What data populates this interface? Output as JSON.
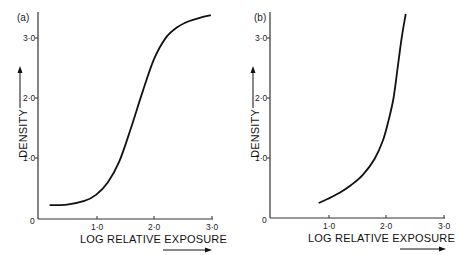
{
  "chart_data": [
    {
      "type": "line",
      "panel": "(a)",
      "xlabel": "LOG RELATIVE EXPOSURE",
      "ylabel": "DENSITY",
      "xlim": [
        0,
        3.0
      ],
      "ylim": [
        0,
        3.4
      ],
      "xticks": [
        "1·0",
        "2·0",
        "3·0"
      ],
      "yticks": [
        "0",
        "1·0",
        "2·0",
        "3·0"
      ],
      "grid": false,
      "x": [
        0.2,
        0.5,
        0.8,
        1.0,
        1.2,
        1.4,
        1.6,
        1.8,
        2.0,
        2.2,
        2.4,
        2.6,
        2.8,
        2.98
      ],
      "y": [
        0.23,
        0.24,
        0.3,
        0.4,
        0.6,
        0.95,
        1.5,
        2.1,
        2.65,
        3.0,
        3.18,
        3.28,
        3.34,
        3.38
      ]
    },
    {
      "type": "line",
      "panel": "(b)",
      "xlabel": "LOG RELATIVE EXPOSURE",
      "ylabel": "DENSITY",
      "xlim": [
        0,
        3.0
      ],
      "ylim": [
        0,
        3.4
      ],
      "xticks": [
        "1·0",
        "2·0",
        "3·0"
      ],
      "yticks": [
        "0",
        "1·0",
        "2·0",
        "3·0"
      ],
      "grid": false,
      "x": [
        0.84,
        1.0,
        1.2,
        1.4,
        1.6,
        1.8,
        1.95,
        2.05,
        2.13,
        2.2,
        2.27,
        2.34
      ],
      "y": [
        0.25,
        0.32,
        0.42,
        0.55,
        0.72,
        0.98,
        1.3,
        1.65,
        2.0,
        2.5,
        3.0,
        3.4
      ]
    }
  ],
  "panels": {
    "a": {
      "label": "(a)",
      "xlabel": "LOG RELATIVE EXPOSURE",
      "ylabel": "DENSITY"
    },
    "b": {
      "label": "(b)",
      "xlabel": "LOG RELATIVE EXPOSURE",
      "ylabel": "DENSITY"
    }
  },
  "ticks": {
    "x": [
      "1·0",
      "2·0",
      "3·0"
    ],
    "y": [
      "1·0",
      "2·0",
      "3·0"
    ],
    "origin": "0"
  },
  "colors": {
    "curve": "#111111",
    "axis": "#333333"
  }
}
